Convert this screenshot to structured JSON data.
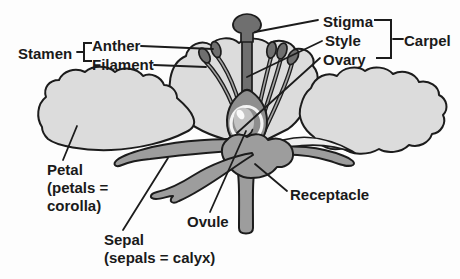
{
  "figure": {
    "colors": {
      "ink": "#1c1c1c",
      "petal": "#dcdcdc",
      "petal_fold": "#efefef",
      "sepal": "#9d9d9d",
      "pistil": "#6f6f6f",
      "ovary_body": "#8e8e8e",
      "ovary_ring": "#f4f4f4",
      "ovule": "#c3c3c3",
      "ovule_highlight": "#fafafa",
      "filament_core": "#a3a3a3"
    },
    "labels": {
      "stamen": "Stamen",
      "anther": "Anther",
      "filament": "Filament",
      "stigma": "Stigma",
      "style": "Style",
      "ovary": "Ovary",
      "carpel": "Carpel",
      "ovule": "Ovule",
      "receptacle": "Receptacle",
      "petal_lines": [
        "Petal",
        "(petals =",
        "corolla)"
      ],
      "sepal_lines": [
        "Sepal",
        "(sepals = calyx)"
      ]
    }
  }
}
